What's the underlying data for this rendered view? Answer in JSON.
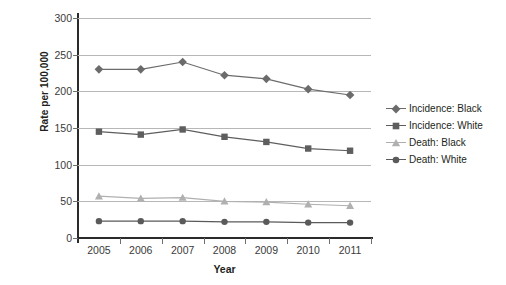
{
  "chart_data": {
    "type": "line",
    "title": "",
    "xlabel": "Year",
    "ylabel": "Rate per 100,000",
    "categories": [
      "2005",
      "2006",
      "2007",
      "2008",
      "2009",
      "2010",
      "2011"
    ],
    "x": [
      2005,
      2006,
      2007,
      2008,
      2009,
      2010,
      2011
    ],
    "xlim": [
      2004.5,
      2011.5
    ],
    "ylim": [
      0,
      300
    ],
    "yticks": [
      0,
      50,
      100,
      150,
      200,
      250,
      300
    ],
    "ytick_labels": [
      "0",
      "50",
      "100",
      "150",
      "200",
      "250",
      "300"
    ],
    "grid": "horizontal",
    "legend_position": "right",
    "series": [
      {
        "name": "Incidence: Black",
        "marker": "diamond",
        "color": "#6b6b6b",
        "values": [
          230,
          230,
          240,
          222,
          217,
          203,
          195
        ]
      },
      {
        "name": "Incidence: White",
        "marker": "square",
        "color": "#5e5e5e",
        "values": [
          145,
          141,
          148,
          138,
          131,
          122,
          119
        ]
      },
      {
        "name": "Death: Black",
        "marker": "triangle",
        "color": "#b0b0b0",
        "values": [
          57,
          54,
          55,
          50,
          49,
          46,
          44
        ]
      },
      {
        "name": "Death: White",
        "marker": "circle",
        "color": "#5a5a5a",
        "values": [
          23,
          23,
          23,
          22,
          22,
          21,
          21
        ]
      }
    ]
  },
  "legend": {
    "items": [
      {
        "label": "Incidence: Black"
      },
      {
        "label": "Incidence: White"
      },
      {
        "label": "Death: Black"
      },
      {
        "label": "Death: White"
      }
    ]
  },
  "colors": {
    "axis": "#2b2b2b",
    "grid": "#b7b7b7",
    "text": "#231f20",
    "background": "#ffffff"
  }
}
